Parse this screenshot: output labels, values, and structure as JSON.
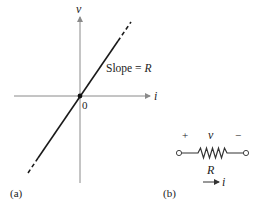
{
  "panel_a": {
    "label": "(a)",
    "x_axis_label": "i",
    "y_axis_label": "v",
    "origin_label": "0",
    "line_annotation_prefix": "Slope = ",
    "line_annotation_var": "R"
  },
  "panel_b": {
    "label": "(b)",
    "plus": "+",
    "voltage": "v",
    "minus": "−",
    "resistor": "R",
    "current": "i"
  },
  "colors": {
    "line": "#1a1a1a",
    "axis": "#8a8a8a",
    "text": "#222222"
  }
}
